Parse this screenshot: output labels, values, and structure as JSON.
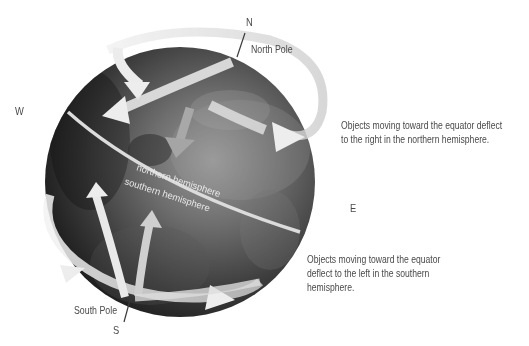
{
  "compass": {
    "north": "N",
    "south": "S",
    "east": "E",
    "west": "W"
  },
  "poles": {
    "north_label": "North Pole",
    "south_label": "South Pole"
  },
  "globe": {
    "northern_label": "northern hemisphere",
    "southern_label": "southern hemisphere"
  },
  "notes": {
    "northern_line1": "Objects moving toward the equator deflect",
    "northern_line2": "to the right in the northern hemisphere.",
    "southern_line1": "Objects moving toward the equator",
    "southern_line2": "deflect to the left in the southern",
    "southern_line3": "hemisphere."
  },
  "colors": {
    "text": "#4a4a4a",
    "globe_dark": "#1e1e1e",
    "globe_light": "#8a8a8a",
    "arrow": "#e6e6e6"
  }
}
